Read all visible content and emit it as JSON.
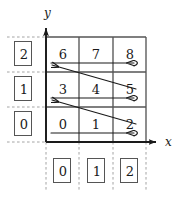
{
  "figure": {
    "axes": {
      "x_label": "x",
      "y_label": "y"
    },
    "grid": {
      "rows": 3,
      "cols": 3,
      "order": "row-major, origin bottom-left",
      "cells": [
        {
          "value": "6",
          "col": 0,
          "row": 2
        },
        {
          "value": "7",
          "col": 1,
          "row": 2
        },
        {
          "value": "8",
          "col": 2,
          "row": 2
        },
        {
          "value": "3",
          "col": 0,
          "row": 1
        },
        {
          "value": "4",
          "col": 1,
          "row": 1
        },
        {
          "value": "5",
          "col": 2,
          "row": 1
        },
        {
          "value": "0",
          "col": 0,
          "row": 0
        },
        {
          "value": "1",
          "col": 1,
          "row": 0
        },
        {
          "value": "2",
          "col": 2,
          "row": 0
        }
      ]
    },
    "y_index_boxes": [
      {
        "value": "2"
      },
      {
        "value": "1"
      },
      {
        "value": "0"
      }
    ],
    "x_index_boxes": [
      {
        "value": "0"
      },
      {
        "value": "1"
      },
      {
        "value": "2"
      }
    ],
    "colors": {
      "grid_line": "#555555",
      "dashed_guide": "#9a9a9a",
      "arrow": "#1a1a1a",
      "text": "#1a1a1a",
      "background": "#ffffff"
    }
  }
}
